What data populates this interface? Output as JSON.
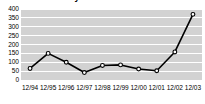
{
  "chart_data": {
    "type": "line",
    "title": "Net Income History",
    "xlabel": "",
    "ylabel": "",
    "categories": [
      "12/94",
      "12/95",
      "12/96",
      "12/97",
      "12/98",
      "12/99",
      "12/00",
      "12/01",
      "12/02",
      "12/03"
    ],
    "values": [
      65,
      150,
      100,
      42,
      82,
      85,
      62,
      52,
      158,
      370
    ],
    "yticks": [
      400,
      350,
      300,
      250,
      200,
      150,
      100,
      50,
      0
    ],
    "ylim": [
      0,
      400
    ],
    "grid": true,
    "legend": null,
    "series_color": "#000000",
    "marker_fill": "#ffffff",
    "plot_background": "#d2d2d2",
    "gridline_color": "#ffffff"
  }
}
